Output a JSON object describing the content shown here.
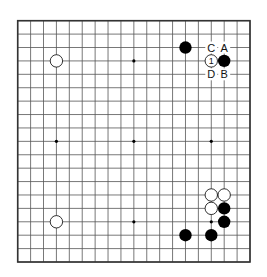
{
  "diagram": {
    "type": "go-board",
    "size": 19,
    "colors": {
      "background": "#ffffff",
      "line": "#555555",
      "border": "#333333",
      "black": "#000000",
      "white": "#ffffff"
    },
    "star_points": [
      [
        3,
        3
      ],
      [
        9,
        3
      ],
      [
        15,
        3
      ],
      [
        3,
        9
      ],
      [
        9,
        9
      ],
      [
        15,
        9
      ],
      [
        3,
        15
      ],
      [
        9,
        15
      ],
      [
        15,
        15
      ]
    ],
    "stones": [
      {
        "color": "black",
        "col": 13,
        "row": 2
      },
      {
        "color": "white",
        "col": 3,
        "row": 3
      },
      {
        "color": "white",
        "col": 15,
        "row": 3,
        "label": "1"
      },
      {
        "color": "black",
        "col": 16,
        "row": 3
      },
      {
        "color": "white",
        "col": 15,
        "row": 13
      },
      {
        "color": "white",
        "col": 16,
        "row": 13
      },
      {
        "color": "white",
        "col": 15,
        "row": 14
      },
      {
        "color": "black",
        "col": 16,
        "row": 14
      },
      {
        "color": "white",
        "col": 3,
        "row": 15
      },
      {
        "color": "black",
        "col": 16,
        "row": 15
      },
      {
        "color": "black",
        "col": 13,
        "row": 16
      },
      {
        "color": "black",
        "col": 15,
        "row": 16
      }
    ],
    "labels": [
      {
        "text": "C",
        "col": 15,
        "row": 2
      },
      {
        "text": "A",
        "col": 16,
        "row": 2
      },
      {
        "text": "D",
        "col": 15,
        "row": 4
      },
      {
        "text": "B",
        "col": 16,
        "row": 4
      }
    ]
  }
}
